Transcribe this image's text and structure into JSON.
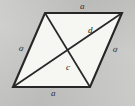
{
  "figure": {
    "type": "geometry-diagram",
    "shape_name": "rhombus",
    "background_color": "#c9c9c7",
    "fill_color": "#f6f6f3",
    "stroke_color": "#272727",
    "label_color": "#2a2a2a",
    "vertices": {
      "top_left": {
        "x": 45,
        "y": 13
      },
      "top_right": {
        "x": 122,
        "y": 13
      },
      "bottom_right": {
        "x": 90,
        "y": 87
      },
      "bottom_left": {
        "x": 13,
        "y": 87
      }
    },
    "diagonal_intersection": {
      "x": 67,
      "y": 50
    },
    "labels": [
      {
        "id": "side-top",
        "text": "a",
        "x": 80,
        "y": 2,
        "tilt": "none"
      },
      {
        "id": "side-right",
        "text": "a",
        "x": 113,
        "y": 45,
        "tilt": "tilt-right"
      },
      {
        "id": "side-bottom",
        "text": "a",
        "x": 51,
        "y": 89,
        "tilt": "none"
      },
      {
        "id": "side-left",
        "text": "a",
        "x": 19,
        "y": 44,
        "tilt": "tilt-right"
      },
      {
        "id": "diagonal-d",
        "text": "d",
        "x": 88,
        "y": 26,
        "tilt": "none"
      },
      {
        "id": "angle-c",
        "text": "c",
        "x": 66,
        "y": 63,
        "tilt": "none"
      }
    ]
  }
}
